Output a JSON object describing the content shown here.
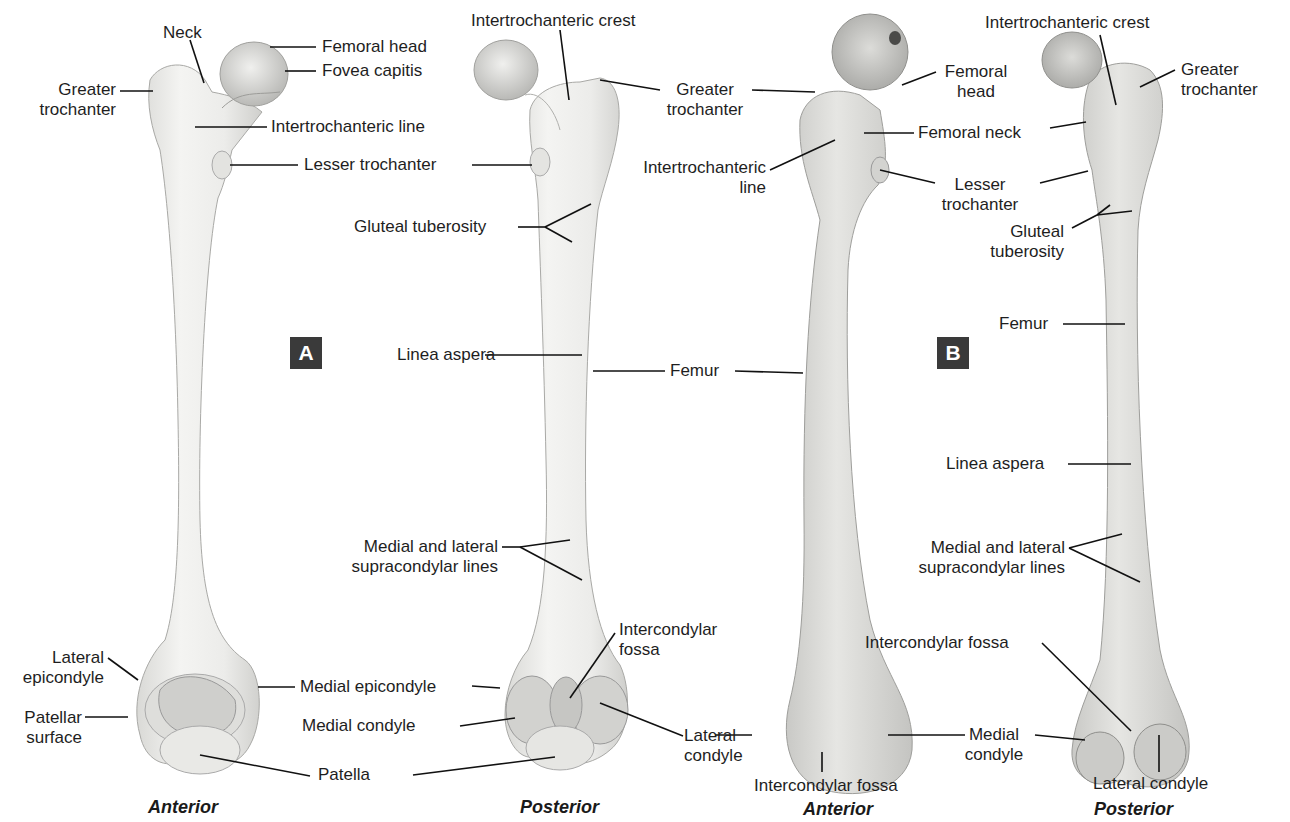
{
  "figure": {
    "panels": [
      {
        "id": "A",
        "style": "illustration",
        "views": [
          "Anterior",
          "Posterior"
        ]
      },
      {
        "id": "B",
        "style": "photograph",
        "views": [
          "Anterior",
          "Posterior"
        ]
      }
    ],
    "badges": {
      "a": "A",
      "b": "B"
    },
    "badge_color": "#3a3a3a",
    "bone_color": "#ececea",
    "labels": {
      "a_anterior": {
        "neck": "Neck",
        "greater_trochanter": [
          "Greater",
          "trochanter"
        ],
        "femoral_head": "Femoral head",
        "fovea_capitis": "Fovea capitis",
        "intertrochanteric_line": "Intertrochanteric line",
        "lesser_trochanter": "Lesser trochanter",
        "lateral_epicondyle": [
          "Lateral",
          "epicondyle"
        ],
        "patellar_surface": [
          "Patellar",
          "surface"
        ],
        "medial_epicondyle": "Medial epicondyle",
        "patella": "Patella",
        "view": "Anterior"
      },
      "a_posterior": {
        "intertrochanteric_crest": "Intertrochanteric crest",
        "greater_trochanter": [
          "Greater",
          "trochanter"
        ],
        "gluteal_tuberosity": "Gluteal tuberosity",
        "linea_aspera": "Linea aspera",
        "femur": "Femur",
        "supracondylar_lines": [
          "Medial and lateral",
          "supracondylar lines"
        ],
        "intercondylar_fossa": [
          "Intercondylar",
          "fossa"
        ],
        "medial_condyle": "Medial condyle",
        "lateral_condyle": [
          "Lateral",
          "condyle"
        ],
        "view": "Posterior"
      },
      "b_anterior": {
        "femoral_head": [
          "Femoral",
          "head"
        ],
        "femoral_neck": "Femoral neck",
        "intertrochanteric_line": [
          "Intertrochanteric",
          "line"
        ],
        "lesser_trochanter": [
          "Lesser",
          "trochanter"
        ],
        "medial_condyle": [
          "Medial",
          "condyle"
        ],
        "intercondylar_fossa": "Intercondylar fossa",
        "view": "Anterior"
      },
      "b_posterior": {
        "intertrochanteric_crest": "Intertrochanteric crest",
        "greater_trochanter": [
          "Greater",
          "trochanter"
        ],
        "gluteal_tuberosity": [
          "Gluteal",
          "tuberosity"
        ],
        "femur": "Femur",
        "linea_aspera": "Linea aspera",
        "supracondylar_lines": [
          "Medial and lateral",
          "supracondylar lines"
        ],
        "intercondylar_fossa": "Intercondylar fossa",
        "lateral_condyle": "Lateral condyle",
        "view": "Posterior"
      }
    }
  }
}
